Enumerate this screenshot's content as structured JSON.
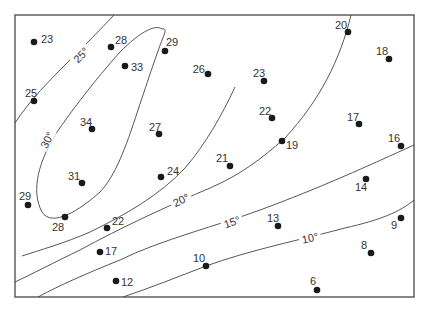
{
  "map": {
    "type": "isotherm contour map",
    "frame": {
      "x": 15,
      "y": 15,
      "width": 399,
      "height": 282
    },
    "isotherms": [
      {
        "label": "30°",
        "value": 30,
        "label_pos": [
          47,
          140
        ],
        "label_angle": -62
      },
      {
        "label": "25°",
        "value": 25,
        "label_pos": [
          81,
          55
        ],
        "label_angle": -45
      },
      {
        "label": "20°",
        "value": 20,
        "label_pos": [
          181,
          200
        ],
        "label_angle": -25
      },
      {
        "label": "15°",
        "value": 15,
        "label_pos": [
          232,
          222
        ],
        "label_angle": -20
      },
      {
        "label": "10°",
        "value": 10,
        "label_pos": [
          310,
          238
        ],
        "label_angle": -12
      }
    ],
    "stations": [
      {
        "value": "23",
        "x": 34,
        "y": 42,
        "lx": 41,
        "ly": 43,
        "anchor": "start"
      },
      {
        "value": "28",
        "x": 111,
        "y": 47,
        "lx": 115,
        "ly": 44,
        "anchor": "start"
      },
      {
        "value": "29",
        "x": 165,
        "y": 51,
        "lx": 166,
        "ly": 46,
        "anchor": "start"
      },
      {
        "value": "33",
        "x": 125,
        "y": 66,
        "lx": 131,
        "ly": 71,
        "anchor": "start"
      },
      {
        "value": "26",
        "x": 208,
        "y": 74,
        "lx": 205,
        "ly": 73,
        "anchor": "end"
      },
      {
        "value": "25",
        "x": 34,
        "y": 101,
        "lx": 31,
        "ly": 97,
        "anchor": "middle"
      },
      {
        "value": "34",
        "x": 92,
        "y": 129,
        "lx": 86,
        "ly": 126,
        "anchor": "middle"
      },
      {
        "value": "27",
        "x": 159,
        "y": 134,
        "lx": 155,
        "ly": 131,
        "anchor": "middle"
      },
      {
        "value": "20",
        "x": 348,
        "y": 32,
        "lx": 341,
        "ly": 29,
        "anchor": "middle"
      },
      {
        "value": "18",
        "x": 389,
        "y": 59,
        "lx": 382,
        "ly": 55,
        "anchor": "middle"
      },
      {
        "value": "23",
        "x": 264,
        "y": 81,
        "lx": 259,
        "ly": 77,
        "anchor": "middle"
      },
      {
        "value": "22",
        "x": 272,
        "y": 118,
        "lx": 265,
        "ly": 115,
        "anchor": "middle"
      },
      {
        "value": "17",
        "x": 359,
        "y": 124,
        "lx": 353,
        "ly": 121,
        "anchor": "middle"
      },
      {
        "value": "19",
        "x": 282,
        "y": 141,
        "lx": 286,
        "ly": 149,
        "anchor": "start"
      },
      {
        "value": "16",
        "x": 401,
        "y": 146,
        "lx": 394,
        "ly": 142,
        "anchor": "middle"
      },
      {
        "value": "21",
        "x": 230,
        "y": 166,
        "lx": 222,
        "ly": 162,
        "anchor": "middle"
      },
      {
        "value": "24",
        "x": 161,
        "y": 177,
        "lx": 167,
        "ly": 175,
        "anchor": "start"
      },
      {
        "value": "31",
        "x": 82,
        "y": 183,
        "lx": 74,
        "ly": 180,
        "anchor": "middle"
      },
      {
        "value": "29",
        "x": 28,
        "y": 205,
        "lx": 25,
        "ly": 200,
        "anchor": "middle"
      },
      {
        "value": "28",
        "x": 65,
        "y": 217,
        "lx": 58,
        "ly": 231,
        "anchor": "middle"
      },
      {
        "value": "14",
        "x": 366,
        "y": 179,
        "lx": 361,
        "ly": 191,
        "anchor": "middle"
      },
      {
        "value": "13",
        "x": 278,
        "y": 226,
        "lx": 273,
        "ly": 222,
        "anchor": "middle"
      },
      {
        "value": "22",
        "x": 107,
        "y": 228,
        "lx": 112,
        "ly": 225,
        "anchor": "start"
      },
      {
        "value": "9",
        "x": 401,
        "y": 218,
        "lx": 394,
        "ly": 229,
        "anchor": "middle"
      },
      {
        "value": "17",
        "x": 100,
        "y": 252,
        "lx": 105,
        "ly": 255,
        "anchor": "start"
      },
      {
        "value": "8",
        "x": 371,
        "y": 253,
        "lx": 364,
        "ly": 249,
        "anchor": "middle"
      },
      {
        "value": "10",
        "x": 206,
        "y": 266,
        "lx": 199,
        "ly": 262,
        "anchor": "middle"
      },
      {
        "value": "12",
        "x": 116,
        "y": 281,
        "lx": 121,
        "ly": 286,
        "anchor": "start"
      },
      {
        "value": "6",
        "x": 317,
        "y": 290,
        "lx": 313,
        "ly": 285,
        "anchor": "middle"
      }
    ]
  }
}
